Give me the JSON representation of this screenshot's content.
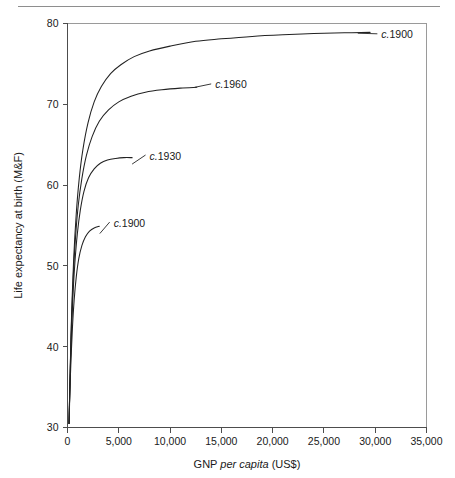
{
  "figure": {
    "has_top_rule": true,
    "background_color": "#ffffff",
    "line_color": "#222222",
    "axis_color": "#4d4d4d",
    "frame_color": "#9a9a9a"
  },
  "chart_data": {
    "type": "line",
    "title": "",
    "xlabel_prefix": "GNP ",
    "xlabel_italic": "per capita",
    "xlabel_suffix": " (US$)",
    "xlabel": "GNP per capita (US$)",
    "ylabel": "Life expectancy at birth (M&F)",
    "xlim": [
      0,
      35000
    ],
    "ylim": [
      30,
      80
    ],
    "xticks": [
      0,
      5000,
      10000,
      15000,
      20000,
      25000,
      30000,
      35000
    ],
    "xticklabels": [
      "0",
      "5,000",
      "10,000",
      "15,000",
      "20,000",
      "25,000",
      "30,000",
      "35,000"
    ],
    "yticks": [
      30,
      40,
      50,
      60,
      70,
      80
    ],
    "yticklabels": [
      "30",
      "40",
      "50",
      "60",
      "70",
      "80"
    ],
    "grid": false,
    "legend_position": "inline-labels",
    "series": [
      {
        "name": "c.1900",
        "label_prefix_italic": "c.",
        "label_year": "1900",
        "label_x": 30600,
        "label_y": 78.6,
        "leader_from_x": 28300,
        "leader_from_y": 78.8,
        "points": [
          [
            150,
            30.5
          ],
          [
            260,
            37.0
          ],
          [
            400,
            44.0
          ],
          [
            600,
            50.8
          ],
          [
            850,
            56.4
          ],
          [
            1150,
            60.9
          ],
          [
            1500,
            64.4
          ],
          [
            2000,
            67.7
          ],
          [
            2600,
            70.3
          ],
          [
            3300,
            72.2
          ],
          [
            4200,
            73.8
          ],
          [
            5200,
            74.9
          ],
          [
            6500,
            75.9
          ],
          [
            8000,
            76.6
          ],
          [
            10000,
            77.2
          ],
          [
            12500,
            77.8
          ],
          [
            15000,
            78.1
          ],
          [
            18000,
            78.4
          ],
          [
            21000,
            78.6
          ],
          [
            24000,
            78.75
          ],
          [
            27000,
            78.85
          ],
          [
            29500,
            78.9
          ]
        ]
      },
      {
        "name": "c.1960",
        "label_prefix_italic": "c.",
        "label_year": "1960",
        "label_x": 14400,
        "label_y": 72.4,
        "leader_from_x": 12400,
        "leader_from_y": 72.1,
        "points": [
          [
            150,
            30.5
          ],
          [
            250,
            36.2
          ],
          [
            380,
            42.6
          ],
          [
            560,
            48.6
          ],
          [
            780,
            53.5
          ],
          [
            1050,
            57.5
          ],
          [
            1400,
            60.8
          ],
          [
            1850,
            63.7
          ],
          [
            2400,
            66.0
          ],
          [
            3100,
            67.9
          ],
          [
            4000,
            69.3
          ],
          [
            5000,
            70.3
          ],
          [
            6200,
            71.0
          ],
          [
            7600,
            71.5
          ],
          [
            9200,
            71.8
          ],
          [
            11000,
            72.0
          ],
          [
            12600,
            72.1
          ]
        ]
      },
      {
        "name": "c.1930",
        "label_prefix_italic": "c.",
        "label_year": "1930",
        "label_x": 8000,
        "label_y": 63.6,
        "leader_from_x": 6300,
        "leader_from_y": 62.6,
        "points": [
          [
            150,
            30.5
          ],
          [
            240,
            35.4
          ],
          [
            360,
            40.8
          ],
          [
            520,
            46.0
          ],
          [
            720,
            50.4
          ],
          [
            960,
            54.0
          ],
          [
            1250,
            56.9
          ],
          [
            1600,
            59.2
          ],
          [
            2050,
            60.9
          ],
          [
            2600,
            62.0
          ],
          [
            3200,
            62.7
          ],
          [
            3900,
            63.1
          ],
          [
            4700,
            63.3
          ],
          [
            5500,
            63.4
          ],
          [
            6300,
            63.4
          ]
        ]
      },
      {
        "name": "c.1900",
        "label_prefix_italic": "c.",
        "label_year": "1900",
        "label_x": 4500,
        "label_y": 55.3,
        "leader_from_x": 3150,
        "leader_from_y": 54.0,
        "points": [
          [
            150,
            30.5
          ],
          [
            230,
            34.2
          ],
          [
            340,
            38.3
          ],
          [
            480,
            42.3
          ],
          [
            650,
            45.8
          ],
          [
            860,
            48.7
          ],
          [
            1100,
            50.9
          ],
          [
            1400,
            52.5
          ],
          [
            1750,
            53.6
          ],
          [
            2150,
            54.3
          ],
          [
            2600,
            54.7
          ],
          [
            3100,
            54.9
          ]
        ]
      }
    ]
  }
}
